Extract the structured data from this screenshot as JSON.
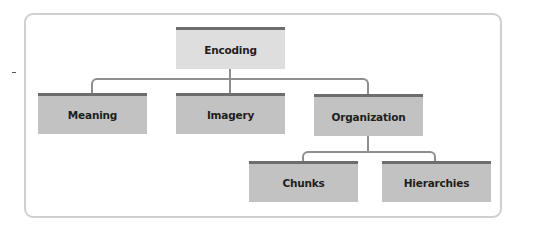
{
  "diagram": {
    "type": "hierarchy",
    "root": {
      "label": "Encoding",
      "children": [
        {
          "label": "Meaning"
        },
        {
          "label": "Imagery"
        },
        {
          "label": "Organization",
          "children": [
            {
              "label": "Chunks"
            },
            {
              "label": "Hierarchies"
            }
          ]
        }
      ]
    },
    "nodes": {
      "encoding": "Encoding",
      "meaning": "Meaning",
      "imagery": "Imagery",
      "organization": "Organization",
      "chunks": "Chunks",
      "hierarchies": "Hierarchies"
    },
    "colors": {
      "node_fill": "#c2c2c2",
      "root_fill": "#dedede",
      "node_top_bar": "#6d6d6d",
      "connector": "#8e8e8e",
      "frame_border": "#cfcfcf",
      "text": "#1e1e1e"
    }
  }
}
